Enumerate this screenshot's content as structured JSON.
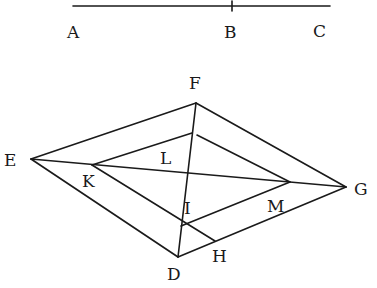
{
  "diagram": {
    "segment": {
      "points": {
        "A": [
          73,
          6
        ],
        "B": [
          232,
          6
        ],
        "C": [
          330,
          6
        ]
      },
      "labels": {
        "A": "A",
        "B": "B",
        "C": "C"
      }
    },
    "points": {
      "F": [
        196,
        103
      ],
      "E": [
        31,
        159
      ],
      "G": [
        346,
        187
      ],
      "D": [
        178,
        257
      ],
      "H": [
        215,
        241
      ],
      "T": [
        192,
        133
      ],
      "K": [
        92,
        165
      ],
      "M": [
        290,
        182
      ],
      "I": [
        181,
        226
      ]
    },
    "labels": {
      "A": "A",
      "B": "B",
      "C": "C",
      "D": "D",
      "E": "E",
      "F": "F",
      "G": "G",
      "H": "H",
      "I": "I",
      "K": "K",
      "L": "L",
      "M": "M"
    },
    "colors": {
      "ink": "#1a1a1a",
      "paper": "#ffffff"
    }
  }
}
